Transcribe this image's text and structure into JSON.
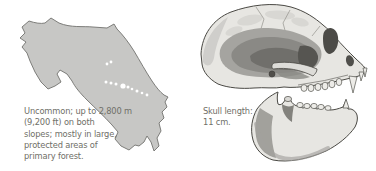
{
  "page": {
    "background": "#ffffff",
    "text_color": "#6f6f68"
  },
  "range_map": {
    "alt": "Gray silhouette range map of Costa Rica with white distribution record dots in the central Talamanca region",
    "land_color": "#c7c7c5",
    "outline_color": "#72726e",
    "marker_color": "#ffffff",
    "markers": [
      {
        "x": 92,
        "y": 52,
        "r": 1.4
      },
      {
        "x": 96,
        "y": 50,
        "r": 1.4
      },
      {
        "x": 91,
        "y": 70,
        "r": 1.5
      },
      {
        "x": 96,
        "y": 71,
        "r": 1.5
      },
      {
        "x": 101,
        "y": 72,
        "r": 1.5
      },
      {
        "x": 108,
        "y": 74,
        "r": 2.6
      },
      {
        "x": 113,
        "y": 75,
        "r": 1.5
      },
      {
        "x": 117,
        "y": 77,
        "r": 1.3
      },
      {
        "x": 122,
        "y": 79,
        "r": 1.5
      },
      {
        "x": 127,
        "y": 81,
        "r": 1.3
      },
      {
        "x": 132,
        "y": 83,
        "r": 1.4
      }
    ],
    "caption_lines": [
      "Uncommon; up to 2,800 m",
      "(9,200 ft) on both",
      "slopes; mostly in large,",
      "protected areas of",
      "primary forest."
    ],
    "caption_text": "Uncommon; up to 2,800 m (9,200 ft) on both slopes; mostly in large, protected areas of primary forest."
  },
  "skull": {
    "alt": "Pencil illustration of a primate skull in lateral view with separated lower jaw",
    "caption_lines": [
      "Skull length:",
      "11 cm."
    ],
    "caption_text": "Skull length: 11 cm."
  }
}
